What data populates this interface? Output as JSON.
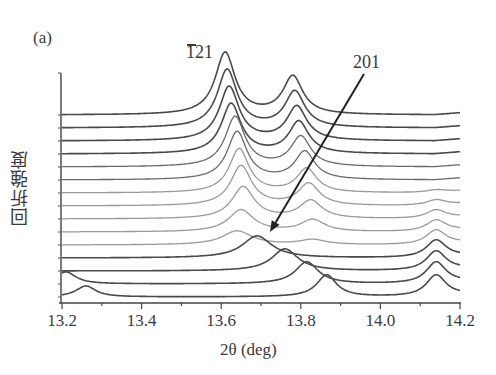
{
  "panel_label": "(a)",
  "annotations": {
    "peak_121": "121",
    "peak_121_overbar_on": "1",
    "peak_201": "201"
  },
  "axes": {
    "xlabel": "2θ (deg)",
    "ylabel": "回折強度",
    "x_ticks": [
      "13.2",
      "13.4",
      "13.6",
      "13.8",
      "14.0",
      "14.2"
    ]
  },
  "chart_data": {
    "type": "line",
    "title": "",
    "xlabel": "2θ (deg)",
    "ylabel": "回折強度 (diffraction intensity, arbitrary, vertically offset)",
    "xlim": [
      13.2,
      14.2
    ],
    "x_ticks": [
      13.2,
      13.4,
      13.6,
      13.8,
      14.0,
      14.2
    ],
    "grid": false,
    "legend": null,
    "annotations": [
      {
        "text": "-121 (overbar on 1)",
        "x": 13.61,
        "position": "above top peak"
      },
      {
        "text": "201",
        "arrow_from": [
          13.96,
          "top"
        ],
        "arrow_to": [
          13.72,
          "curve 11 baseline"
        ]
      }
    ],
    "series": [
      {
        "name": "curve-1",
        "offset_rank": 1,
        "peaks": [
          {
            "x": 13.61,
            "h": 62,
            "w": 0.03
          },
          {
            "x": 13.78,
            "h": 38,
            "w": 0.03
          }
        ],
        "tone": "dark"
      },
      {
        "name": "curve-2",
        "offset_rank": 2,
        "peaks": [
          {
            "x": 13.615,
            "h": 58,
            "w": 0.03
          },
          {
            "x": 13.785,
            "h": 36,
            "w": 0.03
          }
        ],
        "tone": "dark"
      },
      {
        "name": "curve-3",
        "offset_rank": 3,
        "peaks": [
          {
            "x": 13.62,
            "h": 54,
            "w": 0.03
          },
          {
            "x": 13.79,
            "h": 34,
            "w": 0.03
          }
        ],
        "tone": "dark"
      },
      {
        "name": "curve-4",
        "offset_rank": 4,
        "peaks": [
          {
            "x": 13.625,
            "h": 50,
            "w": 0.03
          },
          {
            "x": 13.795,
            "h": 32,
            "w": 0.03
          }
        ],
        "tone": "dark"
      },
      {
        "name": "curve-5",
        "offset_rank": 5,
        "peaks": [
          {
            "x": 13.635,
            "h": 50,
            "w": 0.03
          },
          {
            "x": 13.8,
            "h": 30,
            "w": 0.03
          }
        ],
        "tone": "mid"
      },
      {
        "name": "curve-6",
        "offset_rank": 6,
        "peaks": [
          {
            "x": 13.64,
            "h": 48,
            "w": 0.03
          },
          {
            "x": 13.81,
            "h": 28,
            "w": 0.03
          }
        ],
        "tone": "mid"
      },
      {
        "name": "curve-7",
        "offset_rank": 7,
        "peaks": [
          {
            "x": 13.645,
            "h": 44,
            "w": 0.03
          },
          {
            "x": 13.815,
            "h": 24,
            "w": 0.03
          },
          {
            "x": 14.14,
            "h": 3,
            "w": 0.03
          }
        ],
        "tone": "light"
      },
      {
        "name": "curve-8",
        "offset_rank": 8,
        "peaks": [
          {
            "x": 13.65,
            "h": 40,
            "w": 0.032
          },
          {
            "x": 13.82,
            "h": 22,
            "w": 0.032
          },
          {
            "x": 14.14,
            "h": 6,
            "w": 0.03
          }
        ],
        "tone": "light"
      },
      {
        "name": "curve-9",
        "offset_rank": 9,
        "peaks": [
          {
            "x": 13.655,
            "h": 32,
            "w": 0.034
          },
          {
            "x": 13.825,
            "h": 18,
            "w": 0.034
          },
          {
            "x": 14.14,
            "h": 9,
            "w": 0.03
          }
        ],
        "tone": "light"
      },
      {
        "name": "curve-10",
        "offset_rank": 10,
        "peaks": [
          {
            "x": 13.65,
            "h": 22,
            "w": 0.038
          },
          {
            "x": 13.83,
            "h": 12,
            "w": 0.036
          },
          {
            "x": 14.14,
            "h": 12,
            "w": 0.03
          }
        ],
        "tone": "light"
      },
      {
        "name": "curve-11",
        "offset_rank": 11,
        "peaks": [
          {
            "x": 13.64,
            "h": 14,
            "w": 0.045
          },
          {
            "x": 13.83,
            "h": 5,
            "w": 0.04
          },
          {
            "x": 14.14,
            "h": 15,
            "w": 0.03
          }
        ],
        "tone": "light"
      },
      {
        "name": "curve-12",
        "offset_rank": 12,
        "peaks": [
          {
            "x": 13.69,
            "h": 22,
            "w": 0.045
          },
          {
            "x": 14.14,
            "h": 18,
            "w": 0.03
          }
        ],
        "tone": "dark"
      },
      {
        "name": "curve-13",
        "offset_rank": 13,
        "peaks": [
          {
            "x": 13.76,
            "h": 22,
            "w": 0.04
          },
          {
            "x": 14.14,
            "h": 20,
            "w": 0.03
          }
        ],
        "tone": "dark"
      },
      {
        "name": "curve-14",
        "offset_rank": 14,
        "peaks": [
          {
            "x": 13.815,
            "h": 22,
            "w": 0.035
          },
          {
            "x": 14.14,
            "h": 22,
            "w": 0.03
          },
          {
            "x": 13.21,
            "h": 12,
            "w": 0.03
          }
        ],
        "tone": "dark"
      },
      {
        "name": "curve-15",
        "offset_rank": 15,
        "peaks": [
          {
            "x": 13.865,
            "h": 22,
            "w": 0.03
          },
          {
            "x": 14.14,
            "h": 22,
            "w": 0.03
          },
          {
            "x": 13.26,
            "h": 11,
            "w": 0.03
          }
        ],
        "tone": "dark"
      }
    ]
  },
  "layout": {
    "plot_x0": 62,
    "plot_x1": 460,
    "axis_y": 303,
    "yaxis_top": 73,
    "baseline_top": 115,
    "baseline_step": 13,
    "tones": {
      "dark": "#4a4a4a",
      "mid": "#6a6a6a",
      "light": "#9a9a9a"
    },
    "arrow": {
      "x1": 364,
      "y1": 74,
      "x2": 270,
      "y2": 232,
      "color": "#222222"
    }
  }
}
